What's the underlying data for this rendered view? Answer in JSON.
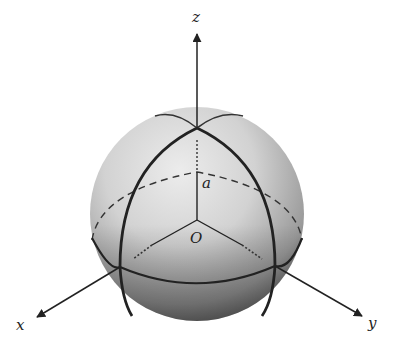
{
  "diagram": {
    "type": "3d-sphere-with-axes",
    "labels": {
      "z_axis": "z",
      "x_axis": "x",
      "y_axis": "y",
      "radius": "a",
      "origin": "O"
    },
    "colors": {
      "background": "#ffffff",
      "stroke": "#222222",
      "sphere_light": "#e6e6e6",
      "sphere_mid": "#c4c4c4",
      "sphere_dark": "#6e6e6e"
    },
    "geometry": {
      "sphere_center": [
        197,
        214
      ],
      "sphere_radius": 107,
      "north_pole": [
        197,
        128
      ],
      "origin_point": [
        197,
        220
      ]
    }
  }
}
